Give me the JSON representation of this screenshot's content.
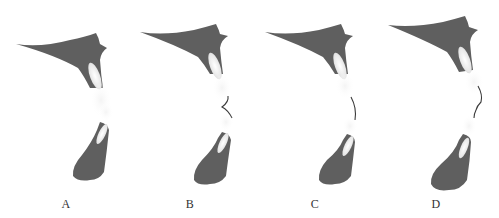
{
  "figure": {
    "panels": [
      {
        "id": "A",
        "label": "A",
        "offset_x": 0,
        "label_x": 56,
        "suture": "none"
      },
      {
        "id": "B",
        "label": "B",
        "offset_x": 124,
        "label_x": 180,
        "suture": "angled"
      },
      {
        "id": "C",
        "label": "C",
        "offset_x": 249,
        "label_x": 305,
        "suture": "curved"
      },
      {
        "id": "D",
        "label": "D",
        "offset_x": 371,
        "label_x": 426,
        "suture": "s-curve"
      }
    ],
    "colors": {
      "bone": "#5f5f5f",
      "tooth_highlight": "#f2f2f2",
      "soft_tissue": "#e6e6e6",
      "suture_line": "#3a3a3a",
      "background": "#ffffff"
    }
  }
}
